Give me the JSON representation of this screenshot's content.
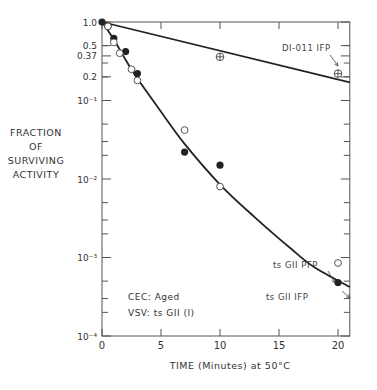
{
  "chart_data": {
    "type": "scatter",
    "title": "",
    "xlabel": "TIME (Minutes) at 50°C",
    "ylabel": "FRACTION OF SURVIVING ACTIVITY",
    "yscale": "log",
    "xlim": [
      0,
      21
    ],
    "ylim": [
      0.0001,
      1.0
    ],
    "x_ticks": [
      0,
      5,
      10,
      15,
      20
    ],
    "y_ticks": [
      {
        "value": 1.0,
        "label": "1.0"
      },
      {
        "value": 0.5,
        "label": "0.5"
      },
      {
        "value": 0.37,
        "label": "0.37"
      },
      {
        "value": 0.2,
        "label": "0.2"
      },
      {
        "value": 0.1,
        "label": "10⁻¹"
      },
      {
        "value": 0.01,
        "label": "10⁻²"
      },
      {
        "value": 0.001,
        "label": "10⁻³"
      },
      {
        "value": 0.0001,
        "label": "10⁻⁴"
      }
    ],
    "grid": false,
    "series": [
      {
        "name": "ts GII IFP",
        "marker": "filled-circle",
        "points": [
          [
            0,
            1.0
          ],
          [
            0.5,
            0.88
          ],
          [
            1,
            0.62
          ],
          [
            2,
            0.42
          ],
          [
            3,
            0.22
          ],
          [
            7,
            0.022
          ],
          [
            10,
            0.015
          ],
          [
            20,
            0.00048
          ]
        ]
      },
      {
        "name": "ts GII PFP",
        "marker": "open-circle",
        "points": [
          [
            0.5,
            0.88
          ],
          [
            1,
            0.55
          ],
          [
            1.5,
            0.4
          ],
          [
            2.5,
            0.25
          ],
          [
            3,
            0.18
          ],
          [
            7,
            0.042
          ],
          [
            10,
            0.008
          ],
          [
            20,
            0.00085
          ]
        ]
      },
      {
        "name": "DI-011 IFP",
        "marker": "crossed-circle",
        "points": [
          [
            10,
            0.36
          ],
          [
            20,
            0.22
          ]
        ]
      }
    ],
    "fit_lines": [
      {
        "name": "DI-011 IFP fit",
        "type": "straight",
        "points": [
          [
            0,
            1.0
          ],
          [
            21,
            0.17
          ]
        ]
      },
      {
        "name": "ts GII fit",
        "type": "curve",
        "points": [
          [
            0,
            1.0
          ],
          [
            1,
            0.6
          ],
          [
            2,
            0.33
          ],
          [
            3,
            0.19
          ],
          [
            5,
            0.072
          ],
          [
            7,
            0.028
          ],
          [
            10,
            0.0085
          ],
          [
            13,
            0.0032
          ],
          [
            16,
            0.0013
          ],
          [
            18,
            0.00075
          ],
          [
            21,
            0.00042
          ]
        ]
      }
    ],
    "annotations": [
      {
        "text": "DI-011 IFP",
        "target": [
          20,
          0.22
        ]
      },
      {
        "text": "ts GII PFP",
        "target": [
          20,
          0.00085
        ]
      },
      {
        "text": "ts GII IFP",
        "target": [
          20,
          0.00048
        ]
      },
      {
        "text": "CEC: Aged"
      },
      {
        "text": "VSV: ts GII (I)"
      }
    ]
  },
  "labels": {
    "ylabel_lines": [
      "FRACTION",
      "OF",
      "SURVIVING",
      "ACTIVITY"
    ],
    "xlabel": "TIME (Minutes) at 50°C",
    "note_line1": "CEC: Aged",
    "note_line2": "VSV: ts GII (I)"
  }
}
